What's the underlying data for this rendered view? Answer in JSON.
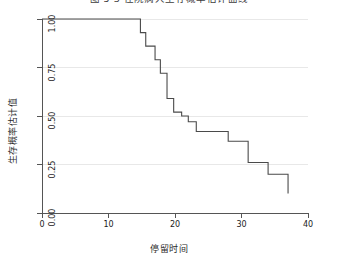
{
  "chart_data": {
    "type": "line",
    "subtype": "kaplan-meier-step",
    "title": "图 5-3  住院病人生存概率估计曲线",
    "title_clipped": true,
    "xlabel": "停留时间",
    "ylabel": "生存概率估计值",
    "xlim": [
      0,
      40
    ],
    "ylim": [
      0,
      1
    ],
    "xticks": [
      0,
      10,
      20,
      30,
      40
    ],
    "xtick_labels": [
      "0",
      "10",
      "20",
      "30",
      "40"
    ],
    "yticks": [
      0,
      0.25,
      0.5,
      0.75,
      1
    ],
    "ytick_labels": [
      "0.00",
      "0.25",
      "0.50",
      "0.75",
      "1.00"
    ],
    "grid": "horizontal",
    "grid_color": "#e8e8e8",
    "legend": null,
    "line_color": "#4a4a4a",
    "line_width": 1.1,
    "background": "#ffffff",
    "series": [
      {
        "name": "生存概率估计值",
        "step": "post",
        "x": [
          0,
          14,
          14.8,
          15.6,
          17.0,
          17.8,
          18.8,
          19.8,
          21.0,
          22.0,
          23.2,
          27.0,
          28.0,
          31.0,
          34.0,
          37.0
        ],
        "y": [
          1.0,
          1.0,
          0.93,
          0.86,
          0.79,
          0.72,
          0.59,
          0.52,
          0.5,
          0.47,
          0.42,
          0.42,
          0.37,
          0.26,
          0.2,
          0.1
        ],
        "points": [
          {
            "t": 0.0,
            "s": 1.0
          },
          {
            "t": 14.0,
            "s": 1.0
          },
          {
            "t": 14.8,
            "s": 0.93
          },
          {
            "t": 15.6,
            "s": 0.86
          },
          {
            "t": 17.0,
            "s": 0.79
          },
          {
            "t": 17.8,
            "s": 0.72
          },
          {
            "t": 18.8,
            "s": 0.59
          },
          {
            "t": 19.8,
            "s": 0.52
          },
          {
            "t": 21.0,
            "s": 0.5
          },
          {
            "t": 22.0,
            "s": 0.47
          },
          {
            "t": 23.2,
            "s": 0.42
          },
          {
            "t": 27.0,
            "s": 0.42
          },
          {
            "t": 28.0,
            "s": 0.37
          },
          {
            "t": 31.0,
            "s": 0.26
          },
          {
            "t": 34.0,
            "s": 0.2
          },
          {
            "t": 37.0,
            "s": 0.1
          }
        ]
      }
    ]
  },
  "axes": {
    "x_title": "停留时间",
    "y_title": "生存概率估计值",
    "x_tick_labels": [
      "0",
      "10",
      "20",
      "30",
      "40"
    ],
    "y_tick_labels": [
      "0.00",
      "0.25",
      "0.50",
      "0.75",
      "1.00"
    ]
  },
  "colors": {
    "curve": "#4a4a4a",
    "axis": "#555555",
    "grid": "#e8e8e8",
    "text": "#1a1a1a",
    "background": "#ffffff"
  }
}
